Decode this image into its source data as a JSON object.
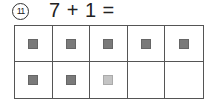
{
  "problem": {
    "number": "11",
    "number_symbol": "⑪",
    "equation": "7 + 1 ="
  },
  "ten_frame": {
    "rows": 2,
    "columns": 5,
    "cells": [
      {
        "state": "dark"
      },
      {
        "state": "dark"
      },
      {
        "state": "dark"
      },
      {
        "state": "dark"
      },
      {
        "state": "dark"
      },
      {
        "state": "dark"
      },
      {
        "state": "dark"
      },
      {
        "state": "light"
      },
      {
        "state": "empty"
      },
      {
        "state": "empty"
      }
    ]
  },
  "colors": {
    "dark_counter": "#7a7a7a",
    "light_counter": "#c4c4c4",
    "grid_line": "#555555"
  }
}
